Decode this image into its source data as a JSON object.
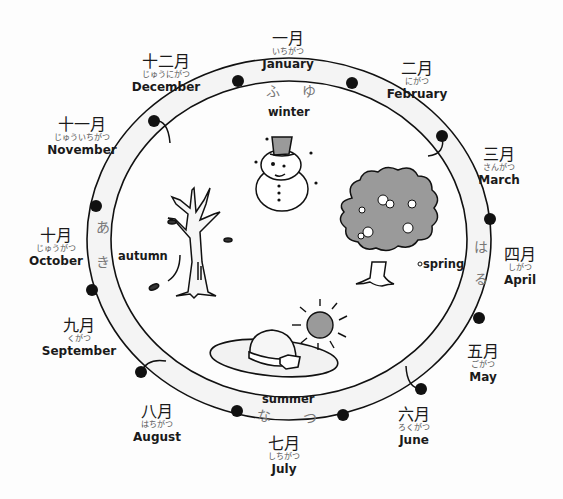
{
  "months": [
    {
      "kanji": "一月",
      "kana": "いちがつ",
      "en": "January"
    },
    {
      "kanji": "二月",
      "kana": "にがつ",
      "en": "February"
    },
    {
      "kanji": "三月",
      "kana": "さんがつ",
      "en": "March"
    },
    {
      "kanji": "四月",
      "kana": "しがつ",
      "en": "April"
    },
    {
      "kanji": "五月",
      "kana": "ごがつ",
      "en": "May"
    },
    {
      "kanji": "六月",
      "kana": "ろくがつ",
      "en": "June"
    },
    {
      "kanji": "七月",
      "kana": "しちがつ",
      "en": "July"
    },
    {
      "kanji": "八月",
      "kana": "はちがつ",
      "en": "August"
    },
    {
      "kanji": "九月",
      "kana": "くがつ",
      "en": "September"
    },
    {
      "kanji": "十月",
      "kana": "じゅうがつ",
      "en": "October"
    },
    {
      "kanji": "十一月",
      "kana": "じゅういちがつ",
      "en": "November"
    },
    {
      "kanji": "十二月",
      "kana": "じゅうにがつ",
      "en": "December"
    }
  ],
  "seasons": {
    "winter": {
      "en": "winter",
      "hira": [
        "ふ",
        "ゆ"
      ]
    },
    "spring": {
      "en": "spring",
      "hira": [
        "は",
        "る"
      ]
    },
    "summer": {
      "en": "summer",
      "hira": [
        "な",
        "つ"
      ]
    },
    "autumn": {
      "en": "autumn",
      "hira": [
        "あ",
        "き"
      ]
    }
  },
  "colors": {
    "ring_fill": "#f4f4f4",
    "ink": "#111111",
    "gray_fill": "#9a9a9a",
    "hira_text": "#777777"
  },
  "icons": [
    "snowman-icon",
    "cherry-tree-icon",
    "bare-tree-icon",
    "sun-hat-icon",
    "sun-icon"
  ]
}
